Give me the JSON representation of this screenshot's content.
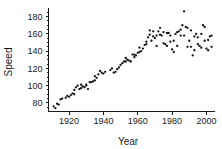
{
  "chart_data": {
    "type": "scatter",
    "title": "",
    "xlabel": "Year",
    "ylabel": "Speed",
    "xlim": [
      1908,
      2005
    ],
    "ylim": [
      70,
      190
    ],
    "xticks": [
      1920,
      1940,
      1960,
      1980,
      2000
    ],
    "yticks": [
      80,
      100,
      120,
      140,
      160,
      180
    ],
    "xtick_labels": [
      "1920",
      "1940",
      "1960",
      "1980",
      "2000"
    ],
    "ytick_labels": [
      "80",
      "100",
      "120",
      "140",
      "160",
      "180"
    ],
    "grid": false,
    "legend": "none",
    "marker": "filled-circle",
    "marker_color": "#111111",
    "points": [
      [
        1911,
        76
      ],
      [
        1912,
        74
      ],
      [
        1913,
        79
      ],
      [
        1914,
        78
      ],
      [
        1915,
        84
      ],
      [
        1916,
        85
      ],
      [
        1919,
        88
      ],
      [
        1920,
        87
      ],
      [
        1921,
        89
      ],
      [
        1922,
        91
      ],
      [
        1923,
        90
      ],
      [
        1924,
        98
      ],
      [
        1925,
        100
      ],
      [
        1926,
        96
      ],
      [
        1927,
        97
      ],
      [
        1928,
        99
      ],
      [
        1929,
        98
      ],
      [
        1930,
        100
      ],
      [
        1931,
        96
      ],
      [
        1932,
        104
      ],
      [
        1933,
        104
      ],
      [
        1934,
        105
      ],
      [
        1935,
        106
      ],
      [
        1936,
        109
      ],
      [
        1937,
        113
      ],
      [
        1938,
        117
      ],
      [
        1939,
        115
      ],
      [
        1940,
        114
      ],
      [
        1946,
        115
      ],
      [
        1947,
        116
      ],
      [
        1948,
        119
      ],
      [
        1949,
        121
      ],
      [
        1950,
        124
      ],
      [
        1951,
        126
      ],
      [
        1952,
        128
      ],
      [
        1953,
        128
      ],
      [
        1954,
        130
      ],
      [
        1955,
        129
      ],
      [
        1956,
        128
      ],
      [
        1957,
        136
      ],
      [
        1958,
        136
      ],
      [
        1959,
        135
      ],
      [
        1960,
        138
      ],
      [
        1961,
        139
      ],
      [
        1962,
        140
      ],
      [
        1963,
        143
      ],
      [
        1964,
        147
      ],
      [
        1965,
        151
      ],
      [
        1966,
        156
      ],
      [
        1967,
        159
      ],
      [
        1968,
        152
      ],
      [
        1969,
        157
      ],
      [
        1970,
        155
      ],
      [
        1971,
        158
      ],
      [
        1972,
        163
      ],
      [
        1973,
        159
      ],
      [
        1974,
        158
      ],
      [
        1975,
        149
      ],
      [
        1976,
        148
      ],
      [
        1977,
        161
      ],
      [
        1978,
        161
      ],
      [
        1979,
        158
      ],
      [
        1980,
        142
      ],
      [
        1981,
        139
      ],
      [
        1982,
        160
      ],
      [
        1983,
        162
      ],
      [
        1984,
        163
      ],
      [
        1985,
        165
      ],
      [
        1986,
        170
      ],
      [
        1987,
        186
      ],
      [
        1988,
        168
      ],
      [
        1989,
        167
      ],
      [
        1990,
        152
      ],
      [
        1991,
        145
      ],
      [
        1992,
        135
      ],
      [
        1993,
        157
      ],
      [
        1994,
        160
      ],
      [
        1995,
        148
      ],
      [
        1996,
        146
      ],
      [
        1997,
        144
      ],
      [
        1998,
        170
      ],
      [
        1999,
        168
      ],
      [
        2000,
        143
      ],
      [
        2001,
        153
      ],
      [
        2002,
        157
      ],
      [
        2003,
        158
      ],
      [
        1918,
        86
      ],
      [
        1930,
        101
      ],
      [
        1941,
        116
      ],
      [
        1944,
        118
      ],
      [
        1958,
        133
      ],
      [
        1965,
        148
      ],
      [
        1969,
        163
      ],
      [
        1973,
        167
      ],
      [
        1977,
        146
      ],
      [
        1981,
        152
      ],
      [
        1985,
        158
      ],
      [
        1989,
        145
      ],
      [
        1993,
        141
      ],
      [
        1997,
        160
      ],
      [
        2001,
        141
      ],
      [
        2003,
        145
      ],
      [
        1923,
        95
      ],
      [
        1927,
        101
      ],
      [
        1935,
        111
      ],
      [
        1945,
        120
      ],
      [
        1953,
        132
      ],
      [
        1961,
        144
      ],
      [
        1967,
        164
      ],
      [
        1971,
        146
      ],
      [
        1975,
        162
      ],
      [
        1979,
        151
      ],
      [
        1983,
        146
      ],
      [
        1987,
        158
      ],
      [
        1991,
        164
      ],
      [
        1995,
        156
      ],
      [
        1999,
        152
      ]
    ]
  },
  "axis": {
    "y_title": "Speed",
    "x_title": "Year"
  }
}
